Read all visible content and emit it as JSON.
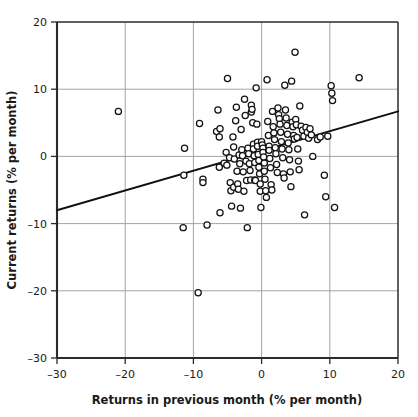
{
  "chart_data": {
    "type": "scatter",
    "title": "",
    "xlabel": "Returns in previous month (% per month)",
    "ylabel": "Current returns (% per month)",
    "xlim": [
      -30,
      20
    ],
    "ylim": [
      -30,
      20
    ],
    "xticks": [
      -30,
      -20,
      -10,
      0,
      10,
      20
    ],
    "yticks": [
      -30,
      -20,
      -10,
      0,
      10,
      20
    ],
    "xtick_labels": [
      "–30",
      "–20",
      "–10",
      "0",
      "10",
      "20"
    ],
    "ytick_labels": [
      "–30",
      "–20",
      "–10",
      "0",
      "10",
      "20"
    ],
    "grid": true,
    "legend": null,
    "marker": "open-circle",
    "marker_size": 3.1,
    "series": [
      {
        "name": "Monthly returns",
        "points": [
          [
            -21.0,
            6.7
          ],
          [
            -11.3,
            1.2
          ],
          [
            -11.4,
            -2.8
          ],
          [
            -11.5,
            -10.6
          ],
          [
            -9.1,
            4.9
          ],
          [
            -9.3,
            -20.3
          ],
          [
            -8.6,
            -3.4
          ],
          [
            -8.6,
            -3.9
          ],
          [
            -8.0,
            -10.2
          ],
          [
            -6.4,
            6.9
          ],
          [
            -6.6,
            3.7
          ],
          [
            -6.2,
            2.9
          ],
          [
            -6.1,
            4.1
          ],
          [
            -6.2,
            -1.6
          ],
          [
            -6.1,
            -8.4
          ],
          [
            -5.5,
            -1.0
          ],
          [
            -5.2,
            0.6
          ],
          [
            -5.0,
            11.6
          ],
          [
            -5.1,
            -1.3
          ],
          [
            -4.7,
            -0.2
          ],
          [
            -4.6,
            -3.9
          ],
          [
            -4.5,
            -5.1
          ],
          [
            -4.2,
            2.9
          ],
          [
            -4.1,
            1.4
          ],
          [
            -4.0,
            -0.4
          ],
          [
            -4.1,
            -4.6
          ],
          [
            -4.4,
            -7.4
          ],
          [
            -3.8,
            5.3
          ],
          [
            -3.7,
            7.3
          ],
          [
            -3.6,
            -2.2
          ],
          [
            -3.5,
            -4.1
          ],
          [
            -3.4,
            -4.9
          ],
          [
            -3.3,
            0.2
          ],
          [
            -3.2,
            -1.1
          ],
          [
            -3.0,
            4.0
          ],
          [
            -3.1,
            -7.7
          ],
          [
            -2.9,
            1.0
          ],
          [
            -2.8,
            0.1
          ],
          [
            -2.7,
            -2.3
          ],
          [
            -2.6,
            -5.2
          ],
          [
            -2.5,
            8.5
          ],
          [
            -2.4,
            6.1
          ],
          [
            -2.3,
            -0.7
          ],
          [
            -2.2,
            -3.6
          ],
          [
            -2.1,
            -10.6
          ],
          [
            -2.0,
            1.2
          ],
          [
            -1.9,
            0.4
          ],
          [
            -1.8,
            -1.1
          ],
          [
            -1.7,
            -2.1
          ],
          [
            -1.6,
            -3.5
          ],
          [
            -1.5,
            7.6
          ],
          [
            -1.5,
            6.6
          ],
          [
            -1.4,
            7.0
          ],
          [
            -1.3,
            5.0
          ],
          [
            -1.2,
            1.8
          ],
          [
            -1.2,
            1.1
          ],
          [
            -1.1,
            0.1
          ],
          [
            -1.0,
            -0.9
          ],
          [
            -1.0,
            -3.5
          ],
          [
            -0.9,
            -3.6
          ],
          [
            -0.8,
            10.2
          ],
          [
            -0.7,
            4.8
          ],
          [
            -0.6,
            2.1
          ],
          [
            -0.6,
            1.5
          ],
          [
            -0.5,
            0.3
          ],
          [
            -0.4,
            -0.6
          ],
          [
            -0.4,
            -1.6
          ],
          [
            -0.3,
            -2.6
          ],
          [
            -0.2,
            -4.1
          ],
          [
            -0.2,
            -5.2
          ],
          [
            -0.1,
            -7.6
          ],
          [
            0.0,
            2.2
          ],
          [
            0.1,
            1.7
          ],
          [
            0.2,
            1.2
          ],
          [
            0.2,
            0.6
          ],
          [
            0.3,
            -0.1
          ],
          [
            0.4,
            -1.0
          ],
          [
            0.4,
            -2.2
          ],
          [
            0.5,
            -3.4
          ],
          [
            0.6,
            -5.1
          ],
          [
            0.7,
            -6.1
          ],
          [
            0.8,
            11.4
          ],
          [
            0.9,
            5.2
          ],
          [
            1.0,
            3.1
          ],
          [
            1.1,
            1.5
          ],
          [
            1.1,
            0.9
          ],
          [
            1.2,
            -0.3
          ],
          [
            1.3,
            -1.7
          ],
          [
            1.4,
            -4.2
          ],
          [
            1.5,
            -5.0
          ],
          [
            1.6,
            6.7
          ],
          [
            1.7,
            4.4
          ],
          [
            1.8,
            3.5
          ],
          [
            1.9,
            2.5
          ],
          [
            2.0,
            1.3
          ],
          [
            2.1,
            0.4
          ],
          [
            2.2,
            -1.2
          ],
          [
            2.3,
            -2.4
          ],
          [
            2.4,
            7.2
          ],
          [
            2.5,
            6.2
          ],
          [
            2.6,
            5.6
          ],
          [
            2.7,
            4.8
          ],
          [
            2.8,
            3.6
          ],
          [
            2.9,
            2.2
          ],
          [
            3.0,
            1.1
          ],
          [
            3.1,
            -0.2
          ],
          [
            3.2,
            -2.6
          ],
          [
            3.3,
            -3.2
          ],
          [
            3.4,
            10.6
          ],
          [
            3.5,
            6.9
          ],
          [
            3.6,
            5.7
          ],
          [
            3.7,
            4.6
          ],
          [
            3.8,
            3.3
          ],
          [
            3.9,
            2.0
          ],
          [
            4.0,
            1.0
          ],
          [
            4.1,
            -0.5
          ],
          [
            4.2,
            -2.3
          ],
          [
            4.3,
            -4.5
          ],
          [
            4.4,
            11.2
          ],
          [
            4.5,
            5.1
          ],
          [
            4.6,
            4.4
          ],
          [
            4.7,
            3.1
          ],
          [
            4.8,
            2.6
          ],
          [
            4.9,
            15.5
          ],
          [
            5.0,
            5.5
          ],
          [
            5.1,
            4.7
          ],
          [
            5.2,
            2.8
          ],
          [
            5.3,
            1.1
          ],
          [
            5.4,
            -0.7
          ],
          [
            5.5,
            -2.0
          ],
          [
            5.6,
            7.5
          ],
          [
            5.8,
            4.5
          ],
          [
            6.0,
            3.9
          ],
          [
            6.2,
            3.0
          ],
          [
            6.3,
            -8.7
          ],
          [
            6.5,
            4.3
          ],
          [
            6.7,
            3.6
          ],
          [
            6.9,
            2.7
          ],
          [
            7.1,
            4.1
          ],
          [
            7.3,
            3.2
          ],
          [
            7.5,
            0.0
          ],
          [
            8.2,
            2.5
          ],
          [
            8.6,
            2.9
          ],
          [
            9.2,
            -2.8
          ],
          [
            9.4,
            -6.0
          ],
          [
            9.7,
            3.0
          ],
          [
            10.2,
            10.5
          ],
          [
            10.3,
            9.4
          ],
          [
            10.4,
            8.3
          ],
          [
            10.7,
            -7.6
          ],
          [
            14.3,
            11.7
          ]
        ]
      }
    ],
    "fit_line": {
      "name": "least-squares regression line",
      "x_start": -30,
      "y_start": -8.0,
      "x_end": 20,
      "y_end": 6.7,
      "slope": 0.294,
      "intercept": 0.82
    }
  }
}
